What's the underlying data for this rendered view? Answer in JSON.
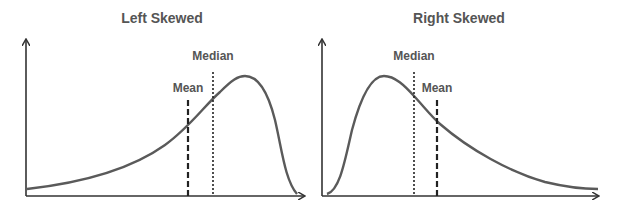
{
  "panels": [
    {
      "title": "Left Skewed",
      "median_label": "Median",
      "mean_label": "Mean"
    },
    {
      "title": "Right Skewed",
      "median_label": "Median",
      "mean_label": "Mean"
    }
  ],
  "colors": {
    "curve": "#5a5a5a",
    "axis": "#333333",
    "text": "#555555",
    "marker": "#222222"
  }
}
